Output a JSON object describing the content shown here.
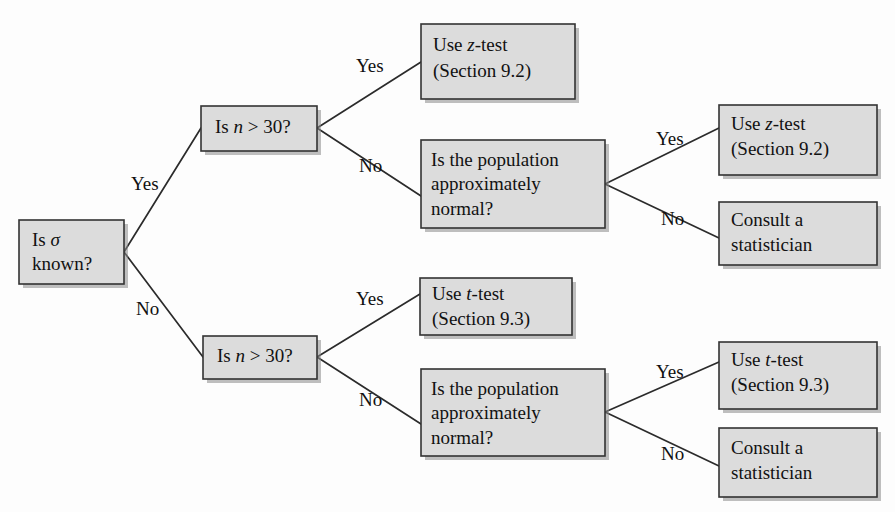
{
  "diagram": {
    "type": "decision-tree-flowchart",
    "colors": {
      "box_fill": "#dcdcdc",
      "box_stroke": "#333333",
      "connector": "#2b2b2b",
      "text": "#111111",
      "background": "#fdfdfd"
    }
  },
  "nodes": {
    "root": {
      "id": "is-sigma-known",
      "lines": [
        "Is σ",
        "known?"
      ],
      "line1_pre": "Is ",
      "line1_italic": "σ",
      "line1_post": "",
      "line2": "known?",
      "x": 19,
      "y": 220,
      "w": 105,
      "h": 64
    },
    "n_gt_30_top": {
      "id": "is-n-gt-30-top",
      "lines": [
        "Is n > 30?"
      ],
      "pre": "Is ",
      "italic": "n",
      "post": " > 30?",
      "x": 201,
      "y": 106,
      "w": 116,
      "h": 45
    },
    "n_gt_30_bottom": {
      "id": "is-n-gt-30-bottom",
      "lines": [
        "Is n > 30?"
      ],
      "pre": "Is ",
      "italic": "n",
      "post": " > 30?",
      "x": 203,
      "y": 336,
      "w": 114,
      "h": 43
    },
    "z_test_top": {
      "id": "use-z-test-top",
      "lines": [
        "Use z-test",
        "(Section 9.2)"
      ],
      "line1_pre": "Use ",
      "line1_italic": "z",
      "line1_post": "-test",
      "line2": "(Section 9.2)",
      "x": 421,
      "y": 24,
      "w": 154,
      "h": 75
    },
    "pop_normal_top": {
      "id": "is-population-normal-top",
      "lines": [
        "Is the population",
        "approximately",
        "normal?"
      ],
      "line1": "Is the population",
      "line2": "approximately",
      "line3": "normal?",
      "x": 421,
      "y": 140,
      "w": 184,
      "h": 88
    },
    "z_test_right": {
      "id": "use-z-test-right",
      "lines": [
        "Use z-test",
        "(Section 9.2)"
      ],
      "line1_pre": "Use ",
      "line1_italic": "z",
      "line1_post": "-test",
      "line2": "(Section 9.2)",
      "x": 719,
      "y": 105,
      "w": 158,
      "h": 70
    },
    "consult_top": {
      "id": "consult-statistician-top",
      "lines": [
        "Consult a",
        "statistician"
      ],
      "line1": "Consult a",
      "line2": "statistician",
      "x": 719,
      "y": 202,
      "w": 158,
      "h": 63
    },
    "t_test_mid": {
      "id": "use-t-test-mid",
      "lines": [
        "Use t-test",
        "(Section 9.3)"
      ],
      "line1_pre": "Use ",
      "line1_italic": "t",
      "line1_post": "-test",
      "line2": "(Section 9.3)",
      "x": 420,
      "y": 278,
      "w": 152,
      "h": 57
    },
    "pop_normal_bottom": {
      "id": "is-population-normal-bottom",
      "lines": [
        "Is the population",
        "approximately",
        "normal?"
      ],
      "line1": "Is the population",
      "line2": "approximately",
      "line3": "normal?",
      "x": 421,
      "y": 369,
      "w": 184,
      "h": 87
    },
    "t_test_right": {
      "id": "use-t-test-right",
      "lines": [
        "Use t-test",
        "(Section 9.3)"
      ],
      "line1_pre": "Use ",
      "line1_italic": "t",
      "line1_post": "-test",
      "line2": "(Section 9.3)",
      "x": 719,
      "y": 342,
      "w": 158,
      "h": 67
    },
    "consult_bottom": {
      "id": "consult-statistician-bottom",
      "lines": [
        "Consult a",
        "statistician"
      ],
      "line1": "Consult a",
      "line2": "statistician",
      "x": 719,
      "y": 428,
      "w": 158,
      "h": 69
    }
  },
  "edge_labels": {
    "root_yes": {
      "text": "Yes",
      "x": 131,
      "y": 186
    },
    "root_no": {
      "text": "No",
      "x": 136,
      "y": 311
    },
    "top_yes": {
      "text": "Yes",
      "x": 356,
      "y": 68
    },
    "top_no": {
      "text": "No",
      "x": 359,
      "y": 168
    },
    "right_yes": {
      "text": "Yes",
      "x": 656,
      "y": 141
    },
    "right_no": {
      "text": "No",
      "x": 661,
      "y": 221
    },
    "bottom_yes": {
      "text": "Yes",
      "x": 356,
      "y": 301
    },
    "bottom_no": {
      "text": "No",
      "x": 359,
      "y": 402
    },
    "bottom_right_yes": {
      "text": "Yes",
      "x": 656,
      "y": 374
    },
    "bottom_right_no": {
      "text": "No",
      "x": 661,
      "y": 456
    }
  },
  "edges": [
    {
      "id": "sigma-yes-to-n30top",
      "from": "is-sigma-known",
      "to": "is-n-gt-30-top",
      "label": "Yes"
    },
    {
      "id": "sigma-no-to-n30bottom",
      "from": "is-sigma-known",
      "to": "is-n-gt-30-bottom",
      "label": "No"
    },
    {
      "id": "n30top-yes-to-ztest",
      "from": "is-n-gt-30-top",
      "to": "use-z-test-top",
      "label": "Yes"
    },
    {
      "id": "n30top-no-to-popnormal",
      "from": "is-n-gt-30-top",
      "to": "is-population-normal-top",
      "label": "No"
    },
    {
      "id": "popnormaltop-yes-to-z",
      "from": "is-population-normal-top",
      "to": "use-z-test-right",
      "label": "Yes"
    },
    {
      "id": "popnormaltop-no-consult",
      "from": "is-population-normal-top",
      "to": "consult-statistician-top",
      "label": "No"
    },
    {
      "id": "n30bot-yes-to-ttest",
      "from": "is-n-gt-30-bottom",
      "to": "use-t-test-mid",
      "label": "Yes"
    },
    {
      "id": "n30bot-no-to-popnormal",
      "from": "is-n-gt-30-bottom",
      "to": "is-population-normal-bottom",
      "label": "No"
    },
    {
      "id": "popnormalbot-yes-to-t",
      "from": "is-population-normal-bottom",
      "to": "use-t-test-right",
      "label": "Yes"
    },
    {
      "id": "popnormalbot-no-consult",
      "from": "is-population-normal-bottom",
      "to": "consult-statistician-bottom",
      "label": "No"
    }
  ]
}
